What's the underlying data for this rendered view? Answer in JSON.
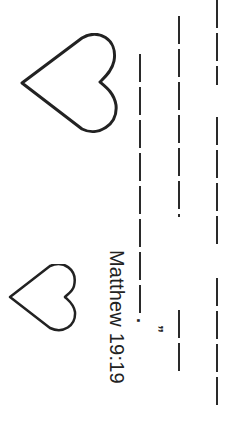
{
  "worksheet": {
    "reference": "Matthew 19:19",
    "period": ".",
    "closing_quote": "”",
    "colors": {
      "ink": "#2a2a2a",
      "background": "#ffffff"
    },
    "writing_lines": [
      {
        "x": 140,
        "segments": [
          [
            54,
            317
          ]
        ]
      },
      {
        "x": 179,
        "segments": [
          [
            16,
            217
          ],
          [
            310,
            372
          ]
        ]
      },
      {
        "x": 217,
        "segments": [
          [
            0,
            85
          ],
          [
            117,
            247
          ],
          [
            278,
            406
          ]
        ]
      }
    ],
    "hearts": [
      {
        "name": "large-heart",
        "x": 20,
        "y": 33,
        "w": 98,
        "h": 100
      },
      {
        "name": "small-heart",
        "x": 8,
        "y": 264,
        "w": 68,
        "h": 66
      }
    ]
  }
}
